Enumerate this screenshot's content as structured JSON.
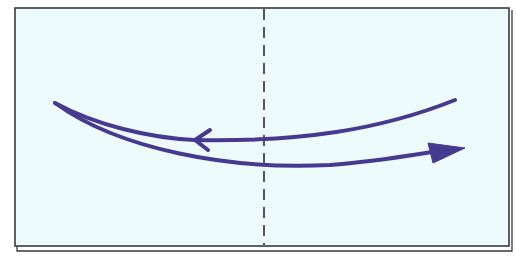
{
  "diagram": {
    "colors": {
      "paper_fill": "#eefbfd",
      "paper_border": "#3a3a3a",
      "arrow": "#47398f",
      "fold_line": "#2e2e2e",
      "background": "#ffffff"
    },
    "elements": {
      "paper": "paper-sheet",
      "fold_line": "valley-fold-line",
      "arrow_back": "fold-back-arrow",
      "arrow_forward": "fold-forward-arrow"
    }
  }
}
